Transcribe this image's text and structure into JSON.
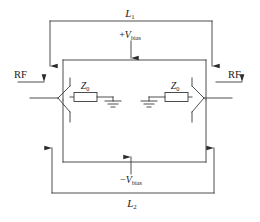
{
  "figure": {
    "kind": "schematic-diagram",
    "background_color": "#ffffff",
    "line_color": "#3a3a3a",
    "text_color": "#1a1a1a"
  },
  "labels": {
    "inductor_top": {
      "base": "L",
      "subscript": "1"
    },
    "inductor_bottom": {
      "base": "L",
      "subscript": "2"
    },
    "bias_positive": {
      "sign": "+",
      "base": "V",
      "subscript": "bias"
    },
    "bias_negative": {
      "sign": "−",
      "base": "V",
      "subscript": "bias"
    },
    "rf_left": "RF",
    "rf_right": "RF",
    "impedance_left": {
      "base": "Z",
      "subscript": "0"
    },
    "impedance_right": {
      "base": "Z",
      "subscript": "0"
    }
  },
  "components": [
    {
      "name": "resistor-z0-left",
      "type": "resistor",
      "label": "Z0"
    },
    {
      "name": "resistor-z0-right",
      "type": "resistor",
      "label": "Z0"
    },
    {
      "name": "ground-left",
      "type": "ground"
    },
    {
      "name": "ground-right",
      "type": "ground"
    },
    {
      "name": "inductor-loop-l1",
      "type": "wire-loop",
      "label": "L1"
    },
    {
      "name": "inductor-loop-l2",
      "type": "wire-loop",
      "label": "L2"
    }
  ],
  "arrows": [
    {
      "name": "arrow-l1-left",
      "direction": "down"
    },
    {
      "name": "arrow-l1-right",
      "direction": "down"
    },
    {
      "name": "arrow-l2-left",
      "direction": "up"
    },
    {
      "name": "arrow-l2-right",
      "direction": "up"
    },
    {
      "name": "arrow-bias-positive",
      "direction": "down"
    },
    {
      "name": "arrow-bias-negative",
      "direction": "up"
    },
    {
      "name": "arrow-rf-input",
      "direction": "right"
    },
    {
      "name": "arrow-rf-output",
      "direction": "right"
    }
  ]
}
